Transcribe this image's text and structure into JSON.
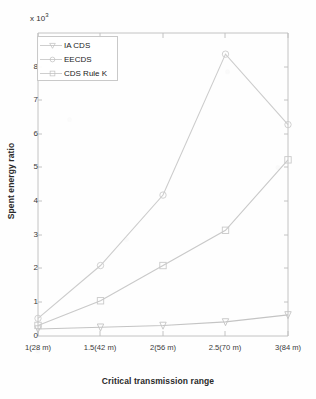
{
  "chart_data": {
    "type": "line",
    "title": "",
    "xlabel": "Critical transmission range",
    "ylabel": "Spent energy ratio",
    "y_multiplier": "x 10",
    "y_multiplier_exp": "3",
    "categories": [
      "1(28 m)",
      "1.5(42 m)",
      "2(56 m)",
      "2.5(70 m)",
      "3(84 m)"
    ],
    "yticks": [
      0,
      1,
      2,
      3,
      4,
      5,
      6,
      7,
      8
    ],
    "ylim": [
      0,
      8.6
    ],
    "grid": false,
    "legend_position": "top-left-inside",
    "series": [
      {
        "name": "IA CDS",
        "marker": "triangle-down",
        "color": "#c4c4c4",
        "values": [
          0.2,
          0.25,
          0.3,
          0.4,
          0.6
        ]
      },
      {
        "name": "EECDS",
        "marker": "circle",
        "color": "#cccccc",
        "values": [
          0.5,
          2.0,
          4.0,
          8.0,
          6.0
        ]
      },
      {
        "name": "CDS Rule K",
        "marker": "square",
        "color": "#c9c9c9",
        "values": [
          0.3,
          1.0,
          2.0,
          3.0,
          5.0
        ]
      }
    ]
  },
  "legend": {
    "items": [
      {
        "label": "IA CDS",
        "marker": "triangle-down-marker-icon"
      },
      {
        "label": "EECDS",
        "marker": "circle-marker-icon"
      },
      {
        "label": "CDS Rule K",
        "marker": "square-marker-icon"
      }
    ]
  },
  "yticklabels": [
    "8",
    "7",
    "6",
    "5",
    "4",
    "3",
    "2",
    "1",
    "0"
  ],
  "colors": {
    "axis": "#b9b9b9",
    "text": "#2a2a2a",
    "line": "#cccccc",
    "background": "#fefefe"
  }
}
